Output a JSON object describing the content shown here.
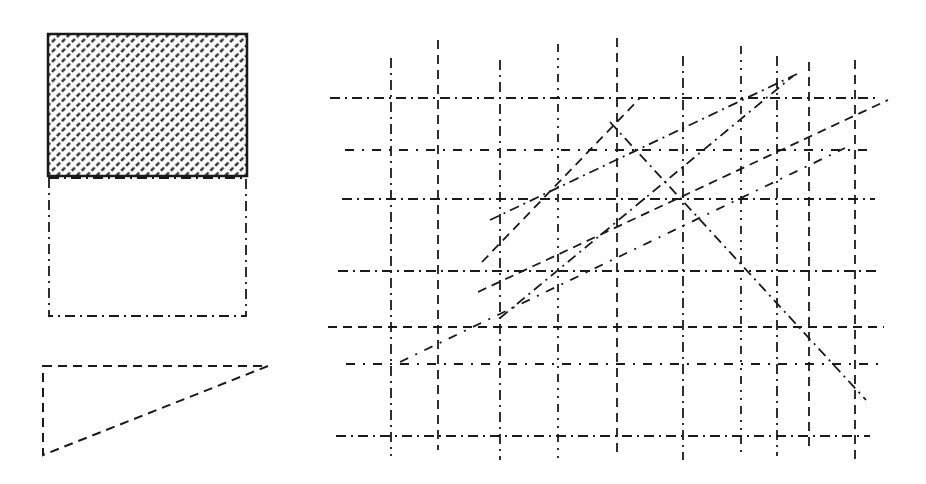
{
  "figure": {
    "background": "#ffffff",
    "ink": "#1a1a1a",
    "legend": {
      "hatched_rect": {
        "x": 48,
        "y": 34,
        "w": 199,
        "h": 142
      },
      "dashdot_rect": {
        "x": 49,
        "y": 178,
        "w": 197,
        "h": 138
      },
      "dashed_triangle": {
        "points": [
          [
            43,
            366
          ],
          [
            268,
            366
          ],
          [
            43,
            455
          ]
        ]
      }
    },
    "grid": {
      "verticals": [
        {
          "x": 391,
          "y1": 58,
          "y2": 456,
          "style": "dashdot"
        },
        {
          "x": 438,
          "y1": 40,
          "y2": 450,
          "style": "dashed"
        },
        {
          "x": 500,
          "y1": 60,
          "y2": 460,
          "style": "dashdot"
        },
        {
          "x": 558,
          "y1": 44,
          "y2": 460,
          "style": "dotted"
        },
        {
          "x": 617,
          "y1": 38,
          "y2": 456,
          "style": "dashed"
        },
        {
          "x": 683,
          "y1": 56,
          "y2": 460,
          "style": "dashdot"
        },
        {
          "x": 741,
          "y1": 46,
          "y2": 456,
          "style": "dotted"
        },
        {
          "x": 777,
          "y1": 56,
          "y2": 456,
          "style": "dashdot"
        },
        {
          "x": 809,
          "y1": 62,
          "y2": 452,
          "style": "dashed"
        },
        {
          "x": 855,
          "y1": 60,
          "y2": 460,
          "style": "dashed"
        }
      ],
      "horizontals": [
        {
          "y": 98,
          "x1": 330,
          "x2": 875,
          "style": "dashdot"
        },
        {
          "y": 150,
          "x1": 345,
          "x2": 868,
          "style": "dashdot-sparse"
        },
        {
          "y": 199,
          "x1": 342,
          "x2": 875,
          "style": "dashdot"
        },
        {
          "y": 271,
          "x1": 338,
          "x2": 880,
          "style": "dashdot"
        },
        {
          "y": 327,
          "x1": 328,
          "x2": 884,
          "style": "dashed"
        },
        {
          "y": 364,
          "x1": 346,
          "x2": 880,
          "style": "dashdot-sparse"
        },
        {
          "y": 436,
          "x1": 336,
          "x2": 870,
          "style": "dashdot"
        }
      ],
      "diagonals": [
        {
          "x1": 400,
          "y1": 362,
          "x2": 845,
          "y2": 148,
          "style": "dashdot-sparse"
        },
        {
          "x1": 478,
          "y1": 292,
          "x2": 888,
          "y2": 100,
          "style": "dashed"
        },
        {
          "x1": 490,
          "y1": 220,
          "x2": 797,
          "y2": 74,
          "style": "dashdot"
        },
        {
          "x1": 482,
          "y1": 262,
          "x2": 640,
          "y2": 98,
          "style": "dashed"
        },
        {
          "x1": 500,
          "y1": 318,
          "x2": 793,
          "y2": 76,
          "style": "dashdot"
        },
        {
          "x1": 610,
          "y1": 122,
          "x2": 866,
          "y2": 400,
          "style": "dashdot"
        }
      ]
    }
  }
}
